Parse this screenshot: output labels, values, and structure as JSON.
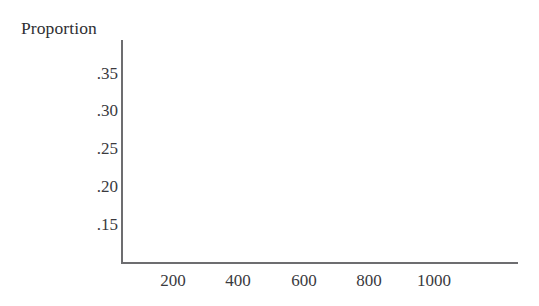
{
  "figure": {
    "background_color": "#ffffff",
    "axis_color": "#6d6d70",
    "text_color": "#3a3a3e",
    "title_color": "#2f2f33"
  },
  "chart_data": {
    "type": "scatter",
    "title": "",
    "ylabel": "Proportion",
    "xlabel": "",
    "series": [],
    "x": [],
    "values": [],
    "xticks": [
      200,
      400,
      600,
      800,
      1000
    ],
    "xtick_labels": [
      "200",
      "400",
      "600",
      "800",
      "1000"
    ],
    "yticks": [
      0.15,
      0.2,
      0.25,
      0.3,
      0.35
    ],
    "ytick_labels": [
      ".35",
      ".30",
      ".25",
      ".20",
      ".15"
    ],
    "xlim": [
      0,
      1200
    ],
    "ylim": [
      0.115,
      0.375
    ],
    "grid": false,
    "legend": null,
    "annotations": [],
    "note": "Empty plotting area: axes frame drawn with no data points, lines, bars or gridlines rendered inside."
  },
  "axis": {
    "title": "Proportion",
    "y_labels": [
      {
        "text": ".35",
        "top": 65
      },
      {
        "text": ".30",
        "top": 102
      },
      {
        "text": ".25",
        "top": 140
      },
      {
        "text": ".20",
        "top": 178
      },
      {
        "text": ".15",
        "top": 216
      }
    ],
    "x_labels": [
      {
        "text": "200",
        "left": 173
      },
      {
        "text": "400",
        "left": 238
      },
      {
        "text": "600",
        "left": 304
      },
      {
        "text": "800",
        "left": 369
      },
      {
        "text": "1000",
        "left": 434
      }
    ]
  }
}
